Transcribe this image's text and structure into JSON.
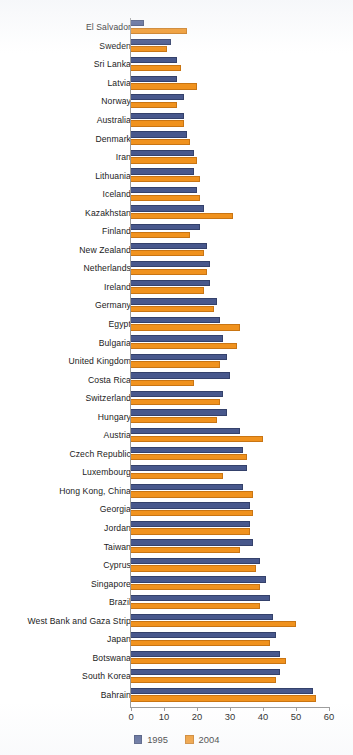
{
  "chart_data": {
    "type": "bar",
    "orientation": "horizontal",
    "title": "",
    "xlabel": "",
    "ylabel": "",
    "xlim": [
      0,
      60
    ],
    "xticks": [
      0,
      10,
      20,
      30,
      40,
      50,
      60
    ],
    "grid": false,
    "legend_position": "bottom-center",
    "colors": {
      "1995": "#48588c",
      "2004": "#f0921e"
    },
    "categories": [
      "El Salvador",
      "Sweden",
      "Sri Lanka",
      "Latvia",
      "Norway",
      "Australia",
      "Denmark",
      "Iran",
      "Lithuania",
      "Iceland",
      "Kazakhstan",
      "Finland",
      "New Zealand",
      "Netherlands",
      "Ireland",
      "Germany",
      "Egypt",
      "Bulgaria",
      "United Kingdom",
      "Costa Rica",
      "Switzerland",
      "Hungary",
      "Austria",
      "Czech Republic",
      "Luxembourg",
      "Hong Kong, China",
      "Georgia",
      "Jordan",
      "Taiwan",
      "Cyprus",
      "Singapore",
      "Brazil",
      "West Bank and Gaza Strip",
      "Japan",
      "Botswana",
      "South Korea",
      "Bahrain"
    ],
    "series": [
      {
        "name": "1995",
        "color": "#48588c",
        "values": [
          4,
          12,
          14,
          14,
          16,
          16,
          17,
          19,
          19,
          20,
          22,
          21,
          23,
          24,
          24,
          26,
          27,
          28,
          29,
          30,
          28,
          29,
          33,
          34,
          35,
          34,
          36,
          36,
          37,
          39,
          41,
          42,
          43,
          44,
          45,
          45,
          55
        ]
      },
      {
        "name": "2004",
        "color": "#f0921e",
        "values": [
          17,
          11,
          15,
          20,
          14,
          16,
          18,
          20,
          21,
          21,
          31,
          18,
          22,
          23,
          22,
          25,
          33,
          32,
          27,
          19,
          27,
          26,
          40,
          35,
          28,
          37,
          37,
          36,
          33,
          38,
          39,
          39,
          50,
          42,
          47,
          44,
          56
        ]
      }
    ]
  },
  "legend": {
    "items": [
      {
        "label": "1995",
        "swatch": "legend-swatch-1995"
      },
      {
        "label": "2004",
        "swatch": "legend-swatch-2004"
      }
    ]
  },
  "axis": {
    "tick_labels": [
      "0",
      "10",
      "20",
      "30",
      "40",
      "50",
      "60"
    ]
  }
}
